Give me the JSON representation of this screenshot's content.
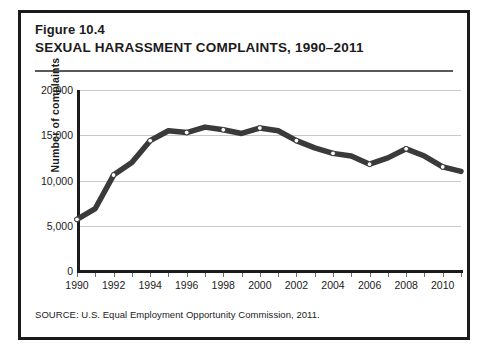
{
  "figure": {
    "number": "Figure 10.4",
    "title": "SEXUAL HARASSMENT COMPLAINTS, 1990–2011",
    "source": "SOURCE: U.S. Equal Employment Opportunity Commission, 2011."
  },
  "colors": {
    "frame": "#1b1b1b",
    "line": "#3a3a3a",
    "marker_fill": "#ffffff",
    "grid": "#c9c9c9",
    "axis": "#1b1b1b",
    "background": "#ffffff"
  },
  "chart_data": {
    "type": "line",
    "title": "SEXUAL HARASSMENT COMPLAINTS, 1990–2011",
    "subtitle": "Figure 10.4",
    "xlabel": "",
    "ylabel": "Number of complaints",
    "source": "SOURCE: U.S. Equal Employment Opportunity Commission, 2011.",
    "grid": true,
    "legend": "none",
    "xlim": [
      1990,
      2011
    ],
    "ylim": [
      0,
      20000
    ],
    "ytick_labels": [
      "20,000",
      "15,000",
      "10,000",
      "5,000",
      "0"
    ],
    "ytick_values": [
      20000,
      15000,
      10000,
      5000,
      0
    ],
    "xtick_labels": [
      "1990",
      "1992",
      "1994",
      "1996",
      "1998",
      "2000",
      "2002",
      "2004",
      "2006",
      "2008",
      "2010"
    ],
    "xtick_values": [
      1990,
      1992,
      1994,
      1996,
      1998,
      2000,
      2002,
      2004,
      2006,
      2008,
      2010
    ],
    "x": [
      1990,
      1991,
      1992,
      1993,
      1994,
      1995,
      1996,
      1997,
      1998,
      1999,
      2000,
      2001,
      2002,
      2003,
      2004,
      2005,
      2006,
      2007,
      2008,
      2009,
      2010,
      2011
    ],
    "markers_at": [
      1990,
      1992,
      1994,
      1996,
      1998,
      2000,
      2002,
      2004,
      2006,
      2008,
      2010
    ],
    "series": [
      {
        "name": "Number of complaints",
        "values": [
          5700,
          6900,
          10600,
          12000,
          14400,
          15500,
          15300,
          15900,
          15600,
          15200,
          15800,
          15500,
          14400,
          13600,
          13000,
          12700,
          11800,
          12500,
          13500,
          12700,
          11500,
          11000
        ]
      }
    ]
  }
}
